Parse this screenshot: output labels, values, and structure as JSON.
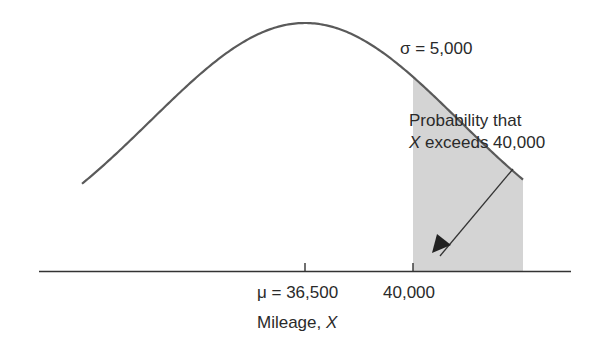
{
  "chart_data": {
    "type": "area",
    "title": "",
    "distribution": "normal",
    "mean": 36500,
    "std_dev": 5000,
    "shaded_region": {
      "from": 40000,
      "to": "upper tail",
      "meaning": "Probability that X exceeds 40,000"
    },
    "xlabel": "Mileage, X",
    "ylabel": "",
    "x_ticks": [
      {
        "value": 36500,
        "label": "μ = 36,500"
      },
      {
        "value": 40000,
        "label": "40,000"
      }
    ],
    "annotations": [
      {
        "text": "σ = 5,000",
        "position": "upper right of curve"
      },
      {
        "text": "Probability that X exceeds 40,000",
        "position": "right, with arrow pointing to shaded tail"
      }
    ],
    "grid": false,
    "legend": "none",
    "colors": {
      "curve": "#5a5a5a",
      "shade": "#d4d4d4",
      "axis": "#333333",
      "text": "#2a2a2a"
    }
  },
  "labels": {
    "sigma": "σ = 5,000",
    "annotation_line1": "Probability that",
    "annotation_line2_var": "X",
    "annotation_line2_rest": " exceeds 40,000",
    "tick_mu": "μ = 36,500",
    "tick_40000": "40,000",
    "xlabel_text": "Mileage, ",
    "xlabel_var": "X"
  }
}
